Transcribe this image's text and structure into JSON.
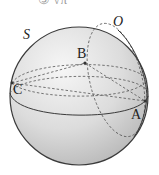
{
  "header": {
    "partial_text": "③ √π"
  },
  "diagram": {
    "type": "sphere",
    "sphere_label": "S",
    "points": [
      {
        "label": "O",
        "italic": true
      },
      {
        "label": "B",
        "italic": false
      },
      {
        "label": "C",
        "italic": false
      },
      {
        "label": "A",
        "italic": false
      }
    ],
    "colors": {
      "sphere_fill_light": "#f4f4f4",
      "sphere_fill_dark": "#bdbdbd",
      "stroke": "#3a3a3a",
      "dashed": "#555555"
    }
  }
}
